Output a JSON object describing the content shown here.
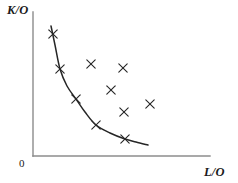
{
  "figure": {
    "title": "",
    "origin_label": "0",
    "axes": {
      "y_label": "K/O",
      "x_label": "L/O",
      "y_axis_x": 33,
      "y_axis_top": 12,
      "y_axis_bottom": 156,
      "x_axis_y": 156,
      "x_axis_left": 33,
      "x_axis_right": 210,
      "axis_color": "#8c8c8c",
      "axis_width": 1.4
    },
    "marker": {
      "glyph": "x",
      "color": "#262626",
      "size": 4.2,
      "stroke_width": 1.1
    },
    "curve": {
      "color": "#262626",
      "width": 1.5,
      "name": "unit-isoquant"
    }
  },
  "chart_data": {
    "type": "scatter",
    "title": "",
    "xlabel": "L/O",
    "ylabel": "K/O",
    "grid": false,
    "legend": null,
    "xlim": [
      0,
      210
    ],
    "ylim": [
      0,
      156
    ],
    "note": "Unit isoquant (efficient frontier) with observed input-ratio points; points on the curve are efficient, points above/right of it are inefficient.",
    "series": [
      {
        "name": "efficient-points-on-isoquant",
        "marker": "x",
        "points": [
          {
            "x": 53,
            "y": 34
          },
          {
            "x": 60,
            "y": 69
          },
          {
            "x": 76,
            "y": 99
          },
          {
            "x": 96,
            "y": 125
          },
          {
            "x": 125,
            "y": 139
          }
        ]
      },
      {
        "name": "inefficient-points",
        "marker": "x",
        "points": [
          {
            "x": 91,
            "y": 64
          },
          {
            "x": 123,
            "y": 68
          },
          {
            "x": 111,
            "y": 90
          },
          {
            "x": 124,
            "y": 112
          },
          {
            "x": 150,
            "y": 104
          }
        ]
      }
    ],
    "curve": {
      "name": "unit-isoquant",
      "path_points": [
        {
          "x": 51,
          "y": 26
        },
        {
          "x": 55,
          "y": 45
        },
        {
          "x": 60,
          "y": 69
        },
        {
          "x": 67,
          "y": 86
        },
        {
          "x": 76,
          "y": 99
        },
        {
          "x": 85,
          "y": 112
        },
        {
          "x": 96,
          "y": 125
        },
        {
          "x": 110,
          "y": 133
        },
        {
          "x": 125,
          "y": 139
        },
        {
          "x": 136,
          "y": 142
        },
        {
          "x": 148,
          "y": 145
        }
      ]
    }
  }
}
